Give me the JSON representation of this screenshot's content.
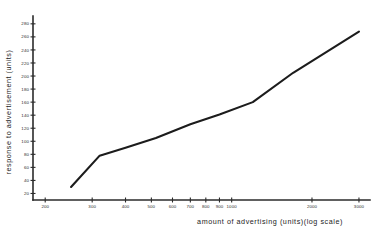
{
  "chart_data": {
    "type": "line",
    "title": "",
    "xlabel": "amount of advertising (units)(log scale)",
    "ylabel": "response to advertisement (units)",
    "xscale": "log",
    "yscale": "linear",
    "grid": false,
    "legend": null,
    "xlim": [
      180,
      3300
    ],
    "ylim": [
      10,
      292
    ],
    "xticks": [
      200,
      300,
      400,
      500,
      600,
      700,
      800,
      900,
      1000,
      2000,
      3000
    ],
    "xticklabels": [
      "200",
      "300",
      "400",
      "500",
      "600",
      "700",
      "800",
      "900",
      "1000",
      "2000",
      "3000"
    ],
    "yticks": [
      20,
      40,
      60,
      80,
      100,
      120,
      140,
      160,
      180,
      200,
      220,
      240,
      260,
      280
    ],
    "yticklabels": [
      "20",
      "40",
      "60",
      "80",
      "100",
      "120",
      "140",
      "160",
      "180",
      "200",
      "220",
      "240",
      "260",
      "280"
    ],
    "series": [
      {
        "name": "response",
        "x": [
          250,
          320,
          400,
          520,
          700,
          900,
          1200,
          1700,
          3000
        ],
        "y": [
          30,
          78,
          90,
          105,
          126,
          141,
          160,
          205,
          268
        ]
      }
    ]
  },
  "axes": {
    "x_title": "amount of advertising (units)(log scale)",
    "y_title": "response to advertisement (units)"
  }
}
